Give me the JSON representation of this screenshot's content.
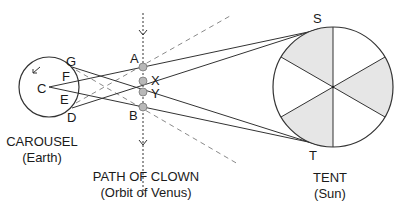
{
  "diagram": {
    "colors": {
      "line": "#333333",
      "dashed": "#8a8a8a",
      "point_fill": "#b8b8b8",
      "sector_fill": "#e6e6e6",
      "text": "#1a1a1a"
    },
    "carousel": {
      "title": "CAROUSEL",
      "subtitle": "(Earth)",
      "labels": {
        "C": "C",
        "D": "D",
        "E": "E",
        "F": "F",
        "G": "G"
      },
      "rotation_arrow": "counter-clockwise-arrow"
    },
    "clown_path": {
      "title": "PATH OF CLOWN",
      "subtitle": "(Orbit of Venus)",
      "points": [
        {
          "label": "A"
        },
        {
          "label": "X"
        },
        {
          "label": "Y"
        },
        {
          "label": "B"
        }
      ],
      "direction": "downward"
    },
    "tent": {
      "title": "TENT",
      "subtitle": "(Sun)",
      "labels": {
        "S": "S",
        "T": "T"
      },
      "sectors": 6,
      "shaded_sectors": 3
    }
  }
}
